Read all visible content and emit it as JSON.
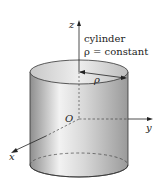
{
  "diagram": {
    "title_line1": "cylinder",
    "title_line2": "ρ = constant",
    "axes": {
      "z": "z",
      "y": "y",
      "x": "x",
      "origin": "O"
    },
    "radius_label": "ρ",
    "colors": {
      "surface_light": "#f4f4f4",
      "surface_dark": "#9a9a9a",
      "line": "#222222"
    }
  }
}
